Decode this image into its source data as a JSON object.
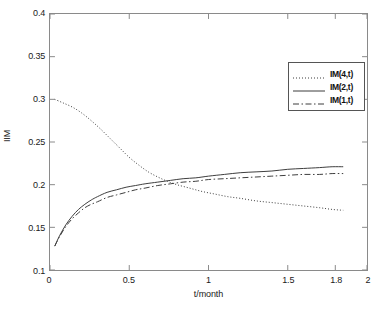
{
  "chart_data": {
    "type": "line",
    "title": "",
    "xlabel": "t/month",
    "ylabel": "IIM",
    "xlim": [
      0,
      2
    ],
    "ylim": [
      0.1,
      0.4
    ],
    "xticks": [
      0,
      0.5,
      1,
      1.5,
      1.8,
      2
    ],
    "xtick_labels": [
      "0",
      "0.5",
      "1",
      "1.5",
      "1.8",
      "2"
    ],
    "yticks": [
      0.1,
      0.15,
      0.2,
      0.25,
      0.3,
      0.35,
      0.4
    ],
    "ytick_labels": [
      "0.1",
      "0.15",
      "0.2",
      "0.25",
      "0.3",
      "0.35",
      "0.4"
    ],
    "grid": false,
    "legend_position": "upper right",
    "series": [
      {
        "name": "IM(4,t)",
        "style": "dotted",
        "color": "#3c3c3c",
        "x": [
          0.03,
          0.08,
          0.14,
          0.2,
          0.26,
          0.32,
          0.38,
          0.44,
          0.5,
          0.56,
          0.62,
          0.68,
          0.74,
          0.8,
          0.88,
          0.96,
          1.04,
          1.12,
          1.2,
          1.3,
          1.4,
          1.5,
          1.6,
          1.7,
          1.78,
          1.85
        ],
        "y": [
          0.3,
          0.296,
          0.291,
          0.284,
          0.275,
          0.265,
          0.254,
          0.243,
          0.232,
          0.223,
          0.215,
          0.209,
          0.204,
          0.2,
          0.196,
          0.192,
          0.189,
          0.186,
          0.184,
          0.181,
          0.179,
          0.177,
          0.175,
          0.173,
          0.171,
          0.17
        ]
      },
      {
        "name": "IM(2,t)",
        "style": "solid",
        "color": "#3c3c3c",
        "x": [
          0.03,
          0.06,
          0.1,
          0.14,
          0.18,
          0.22,
          0.26,
          0.3,
          0.36,
          0.42,
          0.48,
          0.54,
          0.6,
          0.68,
          0.76,
          0.84,
          0.92,
          1.0,
          1.1,
          1.2,
          1.3,
          1.4,
          1.5,
          1.6,
          1.7,
          1.78,
          1.85
        ],
        "y": [
          0.128,
          0.14,
          0.153,
          0.163,
          0.171,
          0.177,
          0.182,
          0.186,
          0.191,
          0.194,
          0.197,
          0.199,
          0.201,
          0.203,
          0.205,
          0.207,
          0.208,
          0.21,
          0.212,
          0.214,
          0.215,
          0.216,
          0.218,
          0.219,
          0.22,
          0.221,
          0.221
        ]
      },
      {
        "name": "IM(1,t)",
        "style": "dashdot",
        "color": "#3c3c3c",
        "x": [
          0.03,
          0.06,
          0.1,
          0.14,
          0.18,
          0.22,
          0.26,
          0.3,
          0.36,
          0.42,
          0.48,
          0.54,
          0.6,
          0.68,
          0.76,
          0.84,
          0.92,
          1.0,
          1.1,
          1.2,
          1.3,
          1.4,
          1.5,
          1.6,
          1.7,
          1.78,
          1.85
        ],
        "y": [
          0.128,
          0.139,
          0.151,
          0.16,
          0.167,
          0.173,
          0.177,
          0.18,
          0.185,
          0.188,
          0.191,
          0.194,
          0.196,
          0.199,
          0.201,
          0.203,
          0.204,
          0.206,
          0.207,
          0.208,
          0.209,
          0.21,
          0.211,
          0.212,
          0.212,
          0.213,
          0.213
        ]
      }
    ]
  },
  "legend": {
    "items": [
      {
        "label": "IM(4,t)",
        "style": "dotted"
      },
      {
        "label": "IM(2,t)",
        "style": "solid"
      },
      {
        "label": "IM(1,t)",
        "style": "dashdot"
      }
    ]
  },
  "axes": {
    "tick_color": "#8a8a8a",
    "line_color": "#3c3c3c"
  }
}
